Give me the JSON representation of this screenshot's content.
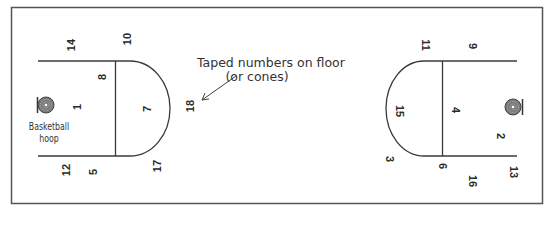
{
  "diagram": {
    "annotation": {
      "line1": "Taped numbers on floor",
      "line2": "(or cones)"
    },
    "hoop_label": {
      "line1": "Basketball",
      "line2": "hoop"
    },
    "left_half_numbers": {
      "n14": "14",
      "n10": "10",
      "n8": "8",
      "n1": "1",
      "n7": "7",
      "n18": "18",
      "n12": "12",
      "n5": "5",
      "n17": "17"
    },
    "right_half_numbers": {
      "n11": "11",
      "n9": "9",
      "n15": "15",
      "n4": "4",
      "n2": "2",
      "n3": "3",
      "n6": "6",
      "n16": "16",
      "n13": "13"
    },
    "colors": {
      "line": "#3a3a3a",
      "border": "#555555",
      "text": "#2a2a2a"
    }
  }
}
